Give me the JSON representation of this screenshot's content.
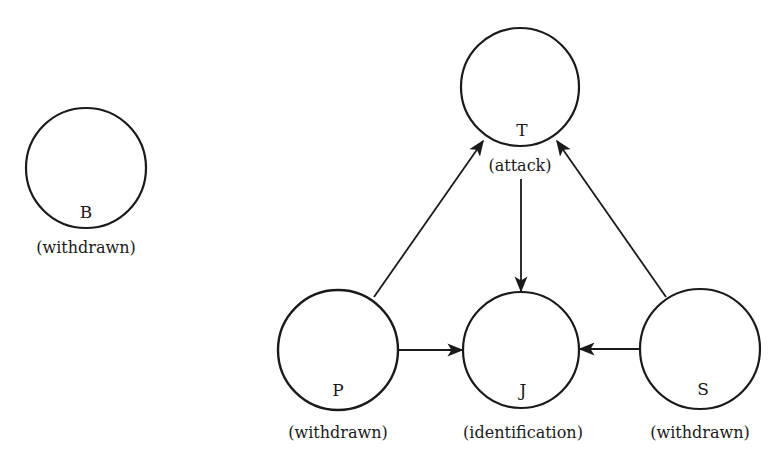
{
  "diagram": {
    "colors": {
      "stroke": "#1a1a1a",
      "background": "#ffffff"
    },
    "nodes": [
      {
        "id": "B",
        "letter": "B",
        "role": "(withdrawn)",
        "cx": 86,
        "cy": 168,
        "r": 60
      },
      {
        "id": "T",
        "letter": "T",
        "role": "(attack)",
        "cx": 520,
        "cy": 87,
        "r": 59
      },
      {
        "id": "P",
        "letter": "P",
        "role": "(withdrawn)",
        "cx": 338,
        "cy": 350,
        "r": 60
      },
      {
        "id": "J",
        "letter": "J",
        "role": "(identification)",
        "cx": 521,
        "cy": 350,
        "r": 58
      },
      {
        "id": "S",
        "letter": "S",
        "role": "(withdrawn)",
        "cx": 700,
        "cy": 349,
        "r": 60
      }
    ],
    "edges": [
      {
        "from": "P",
        "to": "T"
      },
      {
        "from": "S",
        "to": "T"
      },
      {
        "from": "T",
        "to": "J"
      },
      {
        "from": "P",
        "to": "J"
      },
      {
        "from": "S",
        "to": "J"
      }
    ]
  }
}
